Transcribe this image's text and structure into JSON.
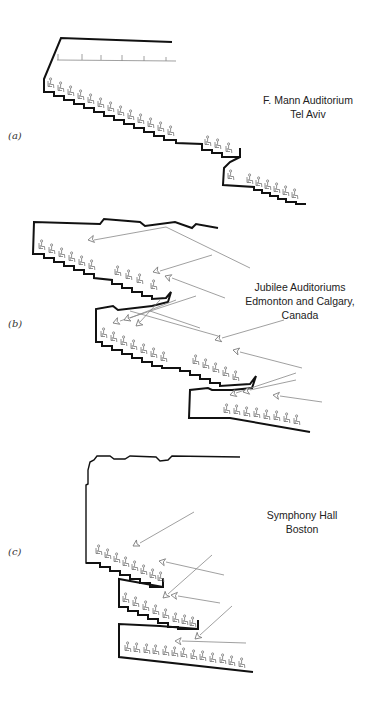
{
  "figure": {
    "panels": [
      {
        "id": "a",
        "label": "(a)",
        "caption_lines": [
          "F. Mann Auditorium",
          "Tel Aviv"
        ]
      },
      {
        "id": "b",
        "label": "(b)",
        "caption_lines": [
          "Jubilee Auditoriums",
          "Edmonton and Calgary,",
          "Canada"
        ]
      },
      {
        "id": "c",
        "label": "(c)",
        "caption_lines": [
          "Symphony Hall",
          "Boston"
        ]
      }
    ],
    "icons": {
      "seat": "seated-listener-icon",
      "arrow": "sound-ray-arrow-icon"
    },
    "colors": {
      "wall": "#111111",
      "ray": "#888888",
      "seat": "#777777",
      "background": "#ffffff"
    }
  }
}
